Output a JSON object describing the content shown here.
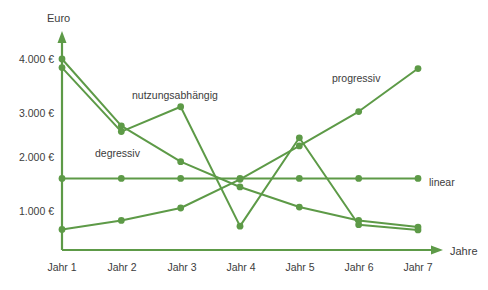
{
  "chart_data": {
    "type": "line",
    "title": "",
    "xlabel": "Jahre",
    "ylabel": "Euro",
    "categories": [
      "Jahr 1",
      "Jahr 2",
      "Jahr 3",
      "Jahr 4",
      "Jahr 5",
      "Jahr 6",
      "Jahr 7"
    ],
    "ylim": [
      0,
      4400
    ],
    "xlim_labels": [
      "Jahr 1",
      "Jahr 7"
    ],
    "ytick_values": [
      1000,
      2000,
      3000,
      4000
    ],
    "ytick_labels": [
      "1.000 €",
      "2.000 €",
      "3.000 €",
      "4.000 €"
    ],
    "grid": false,
    "legend_position": "inline-annotations",
    "accent_color": "#5d9a47",
    "text_color": "#3c3c3c",
    "series": [
      {
        "name": "degressiv",
        "label": "degressiv",
        "values": [
          4000,
          2600,
          1850,
          1320,
          900,
          620,
          480
        ],
        "color": "#5d9a47"
      },
      {
        "name": "nutzungsabhaengig",
        "label": "nutzungsabhängig",
        "values": [
          3820,
          2480,
          3000,
          500,
          2350,
          530,
          420
        ],
        "color": "#5d9a47"
      },
      {
        "name": "linear",
        "label": "linear",
        "values": [
          1500,
          1500,
          1500,
          1500,
          1500,
          1500,
          1500
        ],
        "color": "#5d9a47"
      },
      {
        "name": "progressiv",
        "label": "progressiv",
        "values": [
          430,
          620,
          880,
          1480,
          2180,
          2900,
          3800
        ],
        "color": "#5d9a47"
      }
    ],
    "annotations": [
      {
        "text": "degressiv",
        "x_px": 95,
        "y_px": 156
      },
      {
        "text": "nutzungsabhängig",
        "x_px": 132,
        "y_px": 98
      },
      {
        "text": "progressiv",
        "x_px": 331,
        "y_px": 81
      },
      {
        "text": "linear",
        "x_px": 428,
        "y_px": 182
      },
      {
        "text": "Euro",
        "x_px": 47,
        "y_px": 20
      },
      {
        "text": "Jahre",
        "x_px": 450,
        "y_px": 254
      }
    ]
  },
  "axes": {
    "y_axis_title": "Euro",
    "x_axis_title": "Jahre"
  },
  "legend_inline": {
    "degressiv": "degressiv",
    "nutzungsabhaengig": "nutzungsabhängig",
    "linear": "linear",
    "progressiv": "progressiv"
  }
}
